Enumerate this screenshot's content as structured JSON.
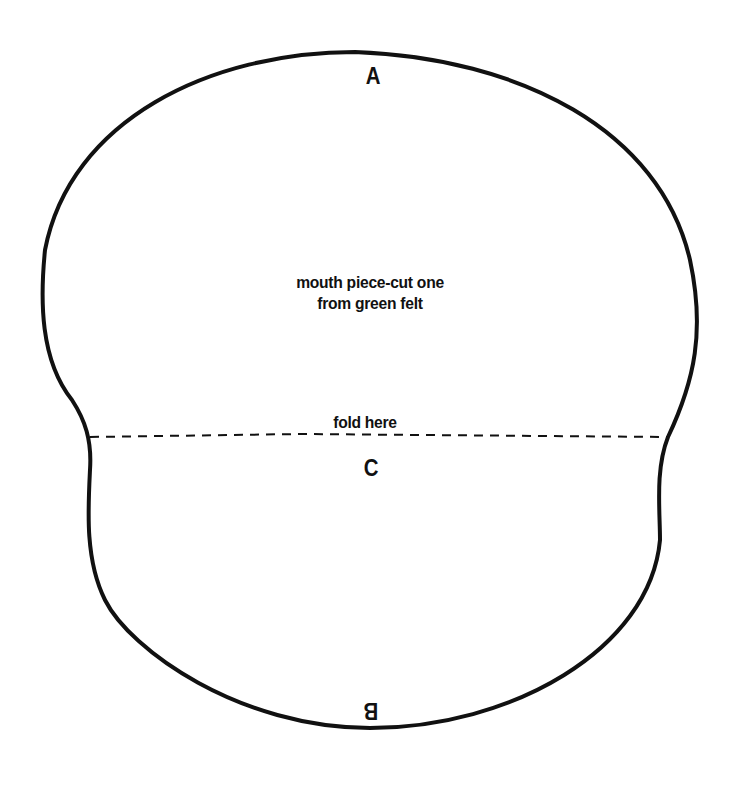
{
  "pattern": {
    "title_line_1": "mouth piece-cut one",
    "title_line_2": "from green felt",
    "fold_label": "fold here",
    "markers": {
      "top": "A",
      "middle": "C",
      "bottom": "B"
    },
    "outline_color": "#111111",
    "background_color": "#ffffff"
  }
}
